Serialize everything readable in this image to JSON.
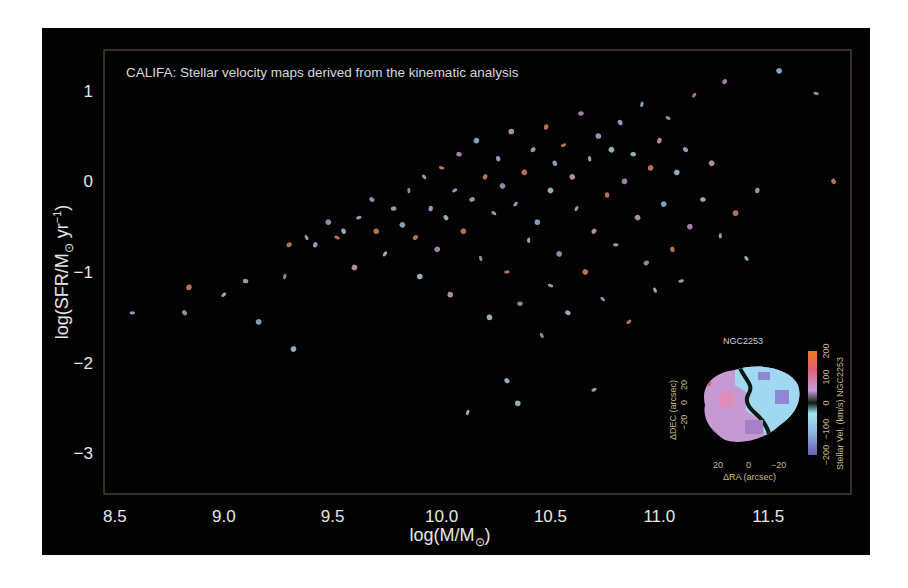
{
  "chart_data": {
    "type": "scatter",
    "title": "CALIFA: Stellar velocity maps derived from the kinematic analysis",
    "xlabel": "log(M/M⊙)",
    "ylabel": "log(SFR/M⊙ yr⁻¹)",
    "xlim": [
      8.45,
      11.88
    ],
    "ylim": [
      -3.45,
      1.45
    ],
    "xticks": [
      8.5,
      9.0,
      9.5,
      10.0,
      10.5,
      11.0,
      11.5
    ],
    "xtick_labels": [
      "8.5",
      "9.0",
      "9.5",
      "10.0",
      "10.5",
      "11.0",
      "11.5"
    ],
    "yticks": [
      1,
      0,
      -1,
      -2,
      -3
    ],
    "ytick_labels": [
      "1",
      "0",
      "−1",
      "−2",
      "−3"
    ],
    "grid": false,
    "marker": "miniature galaxy stellar velocity maps",
    "points": [
      [
        8.58,
        -1.45
      ],
      [
        8.82,
        -1.45
      ],
      [
        8.84,
        -1.17
      ],
      [
        9.0,
        -1.25
      ],
      [
        9.1,
        -1.1
      ],
      [
        9.16,
        -1.55
      ],
      [
        9.28,
        -1.05
      ],
      [
        9.3,
        -0.7
      ],
      [
        9.32,
        -1.85
      ],
      [
        9.38,
        -0.62
      ],
      [
        9.42,
        -0.7
      ],
      [
        9.48,
        -0.45
      ],
      [
        9.52,
        -0.62
      ],
      [
        9.55,
        -0.55
      ],
      [
        9.6,
        -0.95
      ],
      [
        9.62,
        -0.4
      ],
      [
        9.68,
        -0.2
      ],
      [
        9.7,
        -0.55
      ],
      [
        9.74,
        -0.8
      ],
      [
        9.78,
        -0.3
      ],
      [
        9.82,
        -0.48
      ],
      [
        9.85,
        -0.1
      ],
      [
        9.88,
        -0.62
      ],
      [
        9.9,
        -1.05
      ],
      [
        9.92,
        0.05
      ],
      [
        9.95,
        -0.3
      ],
      [
        9.98,
        -0.75
      ],
      [
        10.0,
        0.15
      ],
      [
        10.02,
        -0.4
      ],
      [
        10.04,
        -1.25
      ],
      [
        10.06,
        -0.1
      ],
      [
        10.08,
        0.3
      ],
      [
        10.1,
        -0.55
      ],
      [
        10.12,
        -2.55
      ],
      [
        10.14,
        -0.2
      ],
      [
        10.16,
        0.45
      ],
      [
        10.18,
        -0.85
      ],
      [
        10.2,
        0.05
      ],
      [
        10.22,
        -1.5
      ],
      [
        10.24,
        -0.35
      ],
      [
        10.26,
        0.25
      ],
      [
        10.28,
        -0.05
      ],
      [
        10.3,
        -1.0
      ],
      [
        10.3,
        -2.2
      ],
      [
        10.32,
        0.55
      ],
      [
        10.34,
        -0.25
      ],
      [
        10.36,
        -1.35
      ],
      [
        10.38,
        0.1
      ],
      [
        10.4,
        -0.65
      ],
      [
        10.42,
        0.35
      ],
      [
        10.44,
        -0.45
      ],
      [
        10.46,
        -1.7
      ],
      [
        10.48,
        0.6
      ],
      [
        10.5,
        -0.1
      ],
      [
        10.5,
        -1.15
      ],
      [
        10.52,
        0.2
      ],
      [
        10.54,
        -0.8
      ],
      [
        10.56,
        0.4
      ],
      [
        10.58,
        -1.45
      ],
      [
        10.6,
        0.05
      ],
      [
        10.62,
        -0.3
      ],
      [
        10.64,
        0.75
      ],
      [
        10.66,
        -1.0
      ],
      [
        10.68,
        0.25
      ],
      [
        10.7,
        -0.55
      ],
      [
        10.72,
        0.5
      ],
      [
        10.74,
        -1.3
      ],
      [
        10.76,
        -0.15
      ],
      [
        10.78,
        0.35
      ],
      [
        10.8,
        -0.7
      ],
      [
        10.82,
        0.65
      ],
      [
        10.84,
        0.0
      ],
      [
        10.86,
        -1.55
      ],
      [
        10.88,
        0.3
      ],
      [
        10.9,
        -0.4
      ],
      [
        10.92,
        0.85
      ],
      [
        10.94,
        -0.9
      ],
      [
        10.96,
        0.15
      ],
      [
        10.98,
        -1.2
      ],
      [
        11.0,
        0.45
      ],
      [
        11.02,
        -0.25
      ],
      [
        11.04,
        0.7
      ],
      [
        11.06,
        -0.75
      ],
      [
        11.08,
        0.1
      ],
      [
        11.1,
        -1.1
      ],
      [
        11.12,
        0.35
      ],
      [
        11.14,
        -0.5
      ],
      [
        11.16,
        0.95
      ],
      [
        11.2,
        -0.2
      ],
      [
        11.24,
        0.2
      ],
      [
        11.28,
        -0.6
      ],
      [
        11.3,
        1.1
      ],
      [
        11.35,
        -0.35
      ],
      [
        11.4,
        -0.85
      ],
      [
        11.45,
        -0.1
      ],
      [
        11.55,
        1.22
      ],
      [
        11.72,
        0.97
      ],
      [
        11.8,
        0.0
      ],
      [
        10.35,
        -2.45
      ],
      [
        10.7,
        -2.3
      ]
    ],
    "inset": {
      "title": "NGC2253",
      "xlabel": "ΔRA (arcsec)",
      "ylabel": "ΔDEC (arcsec)",
      "xtick_labels": [
        "20",
        "0",
        "−20"
      ],
      "ytick_labels": [
        "−20",
        "0",
        "20"
      ],
      "colorbar_label": "Stellar Vel. (km/s) NGC2253",
      "colorbar_ticks": [
        "−200",
        "−100",
        "0",
        "100",
        "200"
      ],
      "colorbar_range": [
        -200,
        200
      ],
      "colormap": [
        "#6a5fb5",
        "#8fb7e0",
        "#9fe3f0",
        "#0b1a12",
        "#c79ad9",
        "#e0607a",
        "#f07a1a"
      ]
    }
  },
  "colors": {
    "panel_bg": "#020202",
    "frame": "#6b5a3a",
    "text": "#e6e6e6",
    "point_palette": [
      "#a9c4e8",
      "#c9a0d2",
      "#e08e6a",
      "#b8d9e6",
      "#d4b4c9"
    ]
  }
}
